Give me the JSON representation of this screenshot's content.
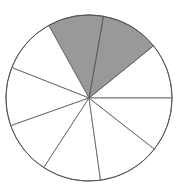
{
  "figure": {
    "title": "",
    "caption": ""
  },
  "chart_data": {
    "type": "pie",
    "title": "",
    "subtitle": "",
    "xlabel": "",
    "ylabel": "",
    "legend_position": "none",
    "grid": false,
    "labels_shown": false,
    "total_slices": 9,
    "shaded_slices": 2,
    "unshaded_slices": 7,
    "shaded_fraction_text": "2/9",
    "center": {
      "x": 89,
      "y": 98
    },
    "radius": 83,
    "colors": {
      "shaded": "#999999",
      "unshaded": "#ffffff",
      "outline": "#555555",
      "divider": "#666666",
      "background": "#ffffff"
    },
    "categories": [
      "slice-1",
      "slice-2",
      "slice-3",
      "slice-4",
      "slice-5",
      "slice-6",
      "slice-7",
      "slice-8",
      "slice-9"
    ],
    "values": [
      39,
      41,
      39,
      39.5,
      41,
      37.5,
      41,
      44,
      38
    ],
    "slices": [
      {
        "name": "slice-1",
        "start_angle": 0,
        "end_angle": 39,
        "sweep": 39,
        "shaded": false
      },
      {
        "name": "slice-2",
        "start_angle": 39,
        "end_angle": 80,
        "sweep": 41,
        "shaded": true
      },
      {
        "name": "slice-3",
        "start_angle": 80,
        "end_angle": 119,
        "sweep": 39,
        "shaded": true
      },
      {
        "name": "slice-4",
        "start_angle": 119,
        "end_angle": 158.5,
        "sweep": 39.5,
        "shaded": false
      },
      {
        "name": "slice-5",
        "start_angle": 158.5,
        "end_angle": 199.5,
        "sweep": 41,
        "shaded": false
      },
      {
        "name": "slice-6",
        "start_angle": 199.5,
        "end_angle": 237,
        "sweep": 37.5,
        "shaded": false
      },
      {
        "name": "slice-7",
        "start_angle": 237,
        "end_angle": 278,
        "sweep": 41,
        "shaded": false
      },
      {
        "name": "slice-8",
        "start_angle": 278,
        "end_angle": 322,
        "sweep": 44,
        "shaded": false
      },
      {
        "name": "slice-9",
        "start_angle": 322,
        "end_angle": 360,
        "sweep": 38,
        "shaded": false
      }
    ],
    "annotations": []
  }
}
